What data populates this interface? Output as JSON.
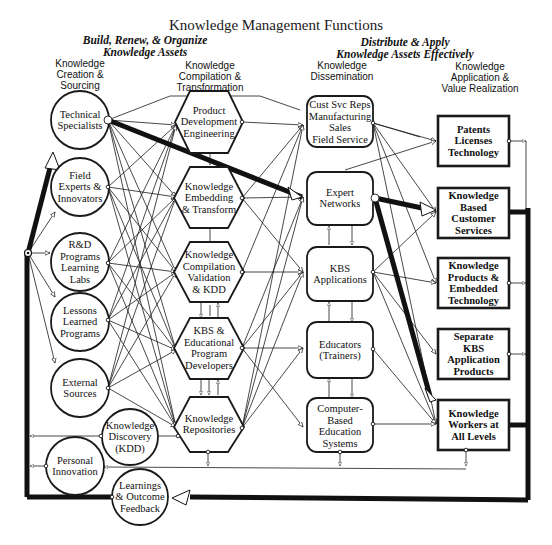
{
  "title": "Knowledge Management Functions",
  "group_headers": {
    "build": "Build, Renew, & Organize\nKnowledge Assets",
    "distribute": "Distribute & Apply\nKnowledge Assets Effectively"
  },
  "column_headers": {
    "creation": "Knowledge\nCreation &\nSourcing",
    "compilation": "Knowledge\nCompilation &\nTransformation",
    "dissemination": "Knowledge\nDissemination",
    "application": "Knowledge\nApplication &\nValue Realization"
  },
  "sources": [
    {
      "label": "Technical\nSpecialists"
    },
    {
      "label": "Field\nExperts &\nInnovators"
    },
    {
      "label": "R&D\nPrograms\nLearning\nLabs"
    },
    {
      "label": "Lessons\nLearned\nPrograms"
    },
    {
      "label": "External\nSources"
    }
  ],
  "transformers": [
    {
      "label": "Product\nDevelopment\nEngineering"
    },
    {
      "label": "Knowledge\nEmbedding\n& Transform"
    },
    {
      "label": "Knowledge\nCompilation\nValidation\n& KDD"
    },
    {
      "label": "KBS &\nEducational\nProgram\nDevelopers"
    },
    {
      "label": "Knowledge\nRepositories"
    }
  ],
  "disseminators": [
    {
      "label": "Cust Svc Reps\nManufacturing\nSales\nField Service"
    },
    {
      "label": "Expert\nNetworks"
    },
    {
      "label": "KBS\nApplications"
    },
    {
      "label": "Educators\n(Trainers)"
    },
    {
      "label": "Computer-\nBased\nEducation\nSystems"
    }
  ],
  "applications": [
    {
      "label": "Patents\nLicenses\nTechnology"
    },
    {
      "label": "Knowledge\nBased\nCustomer\nServices"
    },
    {
      "label": "Knowledge\nProducts &\nEmbedded\nTechnology"
    },
    {
      "label": "Separate\nKBS\nApplication\nProducts"
    },
    {
      "label": "Knowledge\nWorkers at\nAll Levels"
    }
  ],
  "feedback_nodes": [
    {
      "label": "Knowledge\nDiscovery\n(KDD)"
    },
    {
      "label": "Personal\nInnovation"
    },
    {
      "label": "Learnings\n& Outcome\nFeedback"
    }
  ],
  "colors": {
    "ink": "#1a1a1a",
    "background": "#ffffff"
  }
}
